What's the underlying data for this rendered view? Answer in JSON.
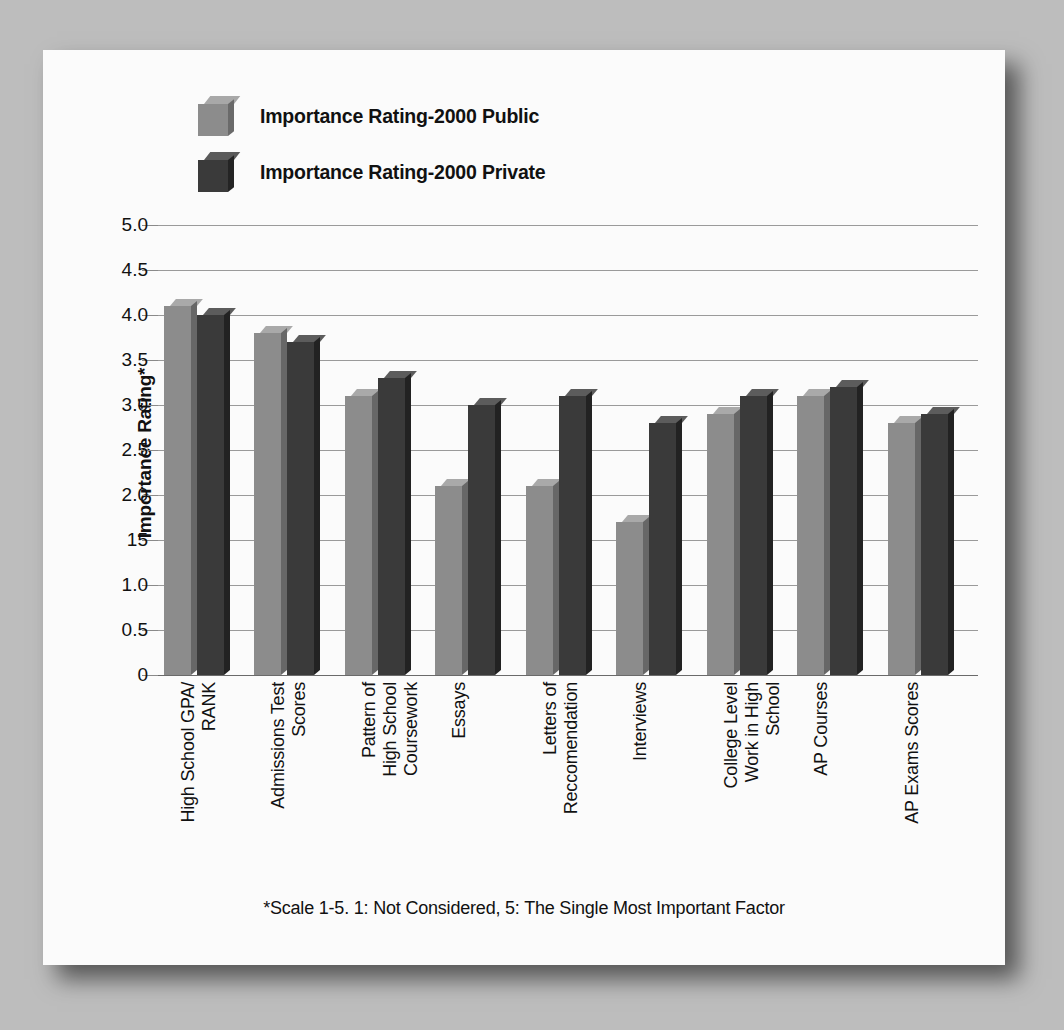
{
  "legend": {
    "items": [
      {
        "label": "Importance Rating-2000 Public",
        "color": "#8c8c8c",
        "key": "public"
      },
      {
        "label": "Importance Rating-2000 Private",
        "color": "#3a3a3a",
        "key": "private"
      }
    ]
  },
  "footnote": "*Scale 1-5. 1: Not Considered, 5: The Single Most Important Factor",
  "chart_data": {
    "type": "bar",
    "title": "",
    "xlabel": "",
    "ylabel": "Importance Rating*",
    "ylim": [
      0,
      5.0
    ],
    "grid": true,
    "legend_position": "top-left",
    "ytick_labels": [
      "5.0",
      "4.5",
      "4.0",
      "3.5",
      "3.0",
      "2.5",
      "2.0",
      "15",
      "1.0",
      "0.5",
      "0"
    ],
    "ytick_values": [
      5.0,
      4.5,
      4.0,
      3.5,
      3.0,
      2.5,
      2.0,
      1.5,
      1.0,
      0.5,
      0
    ],
    "categories": [
      "High School GPA/\nRANK",
      "Admissions Test\nScores",
      "Pattern of\nHigh School\nCoursework",
      "Essays",
      "Letters of\nReccomendation",
      "Interviews",
      "College Level\nWork in High\nSchool",
      "AP Courses",
      "AP Exams Scores"
    ],
    "series": [
      {
        "name": "Importance Rating-2000 Public",
        "color": "#8c8c8c",
        "values": [
          4.1,
          3.8,
          3.1,
          2.1,
          2.1,
          1.7,
          2.9,
          3.1,
          2.8
        ]
      },
      {
        "name": "Importance Rating-2000 Private",
        "color": "#3a3a3a",
        "values": [
          4.0,
          3.7,
          3.3,
          3.0,
          3.1,
          2.8,
          3.1,
          3.2,
          2.9
        ]
      }
    ],
    "annotations": [
      "*Scale 1-5. 1: Not Considered, 5: The Single Most Important Factor"
    ]
  }
}
